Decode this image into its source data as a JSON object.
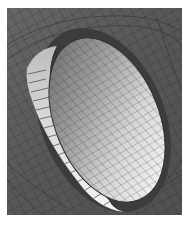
{
  "figure": {
    "colors": {
      "background": "#ffffff",
      "outer_mesh_fill": "#5a5a5a",
      "outer_mesh_lines": "#2e2e2e",
      "rim_band_fill": "#d8d8d8",
      "rim_gap_fill": "#3e3e3e",
      "disc_fill_light": "#e6e6e6",
      "disc_fill_mid": "#a0a0a0",
      "disc_fill_dark": "#6e6e6e",
      "disc_mesh_lines": "#3a3a3a"
    },
    "bounds": {
      "x": 7,
      "y": 8,
      "width": 175,
      "height": 207
    }
  }
}
